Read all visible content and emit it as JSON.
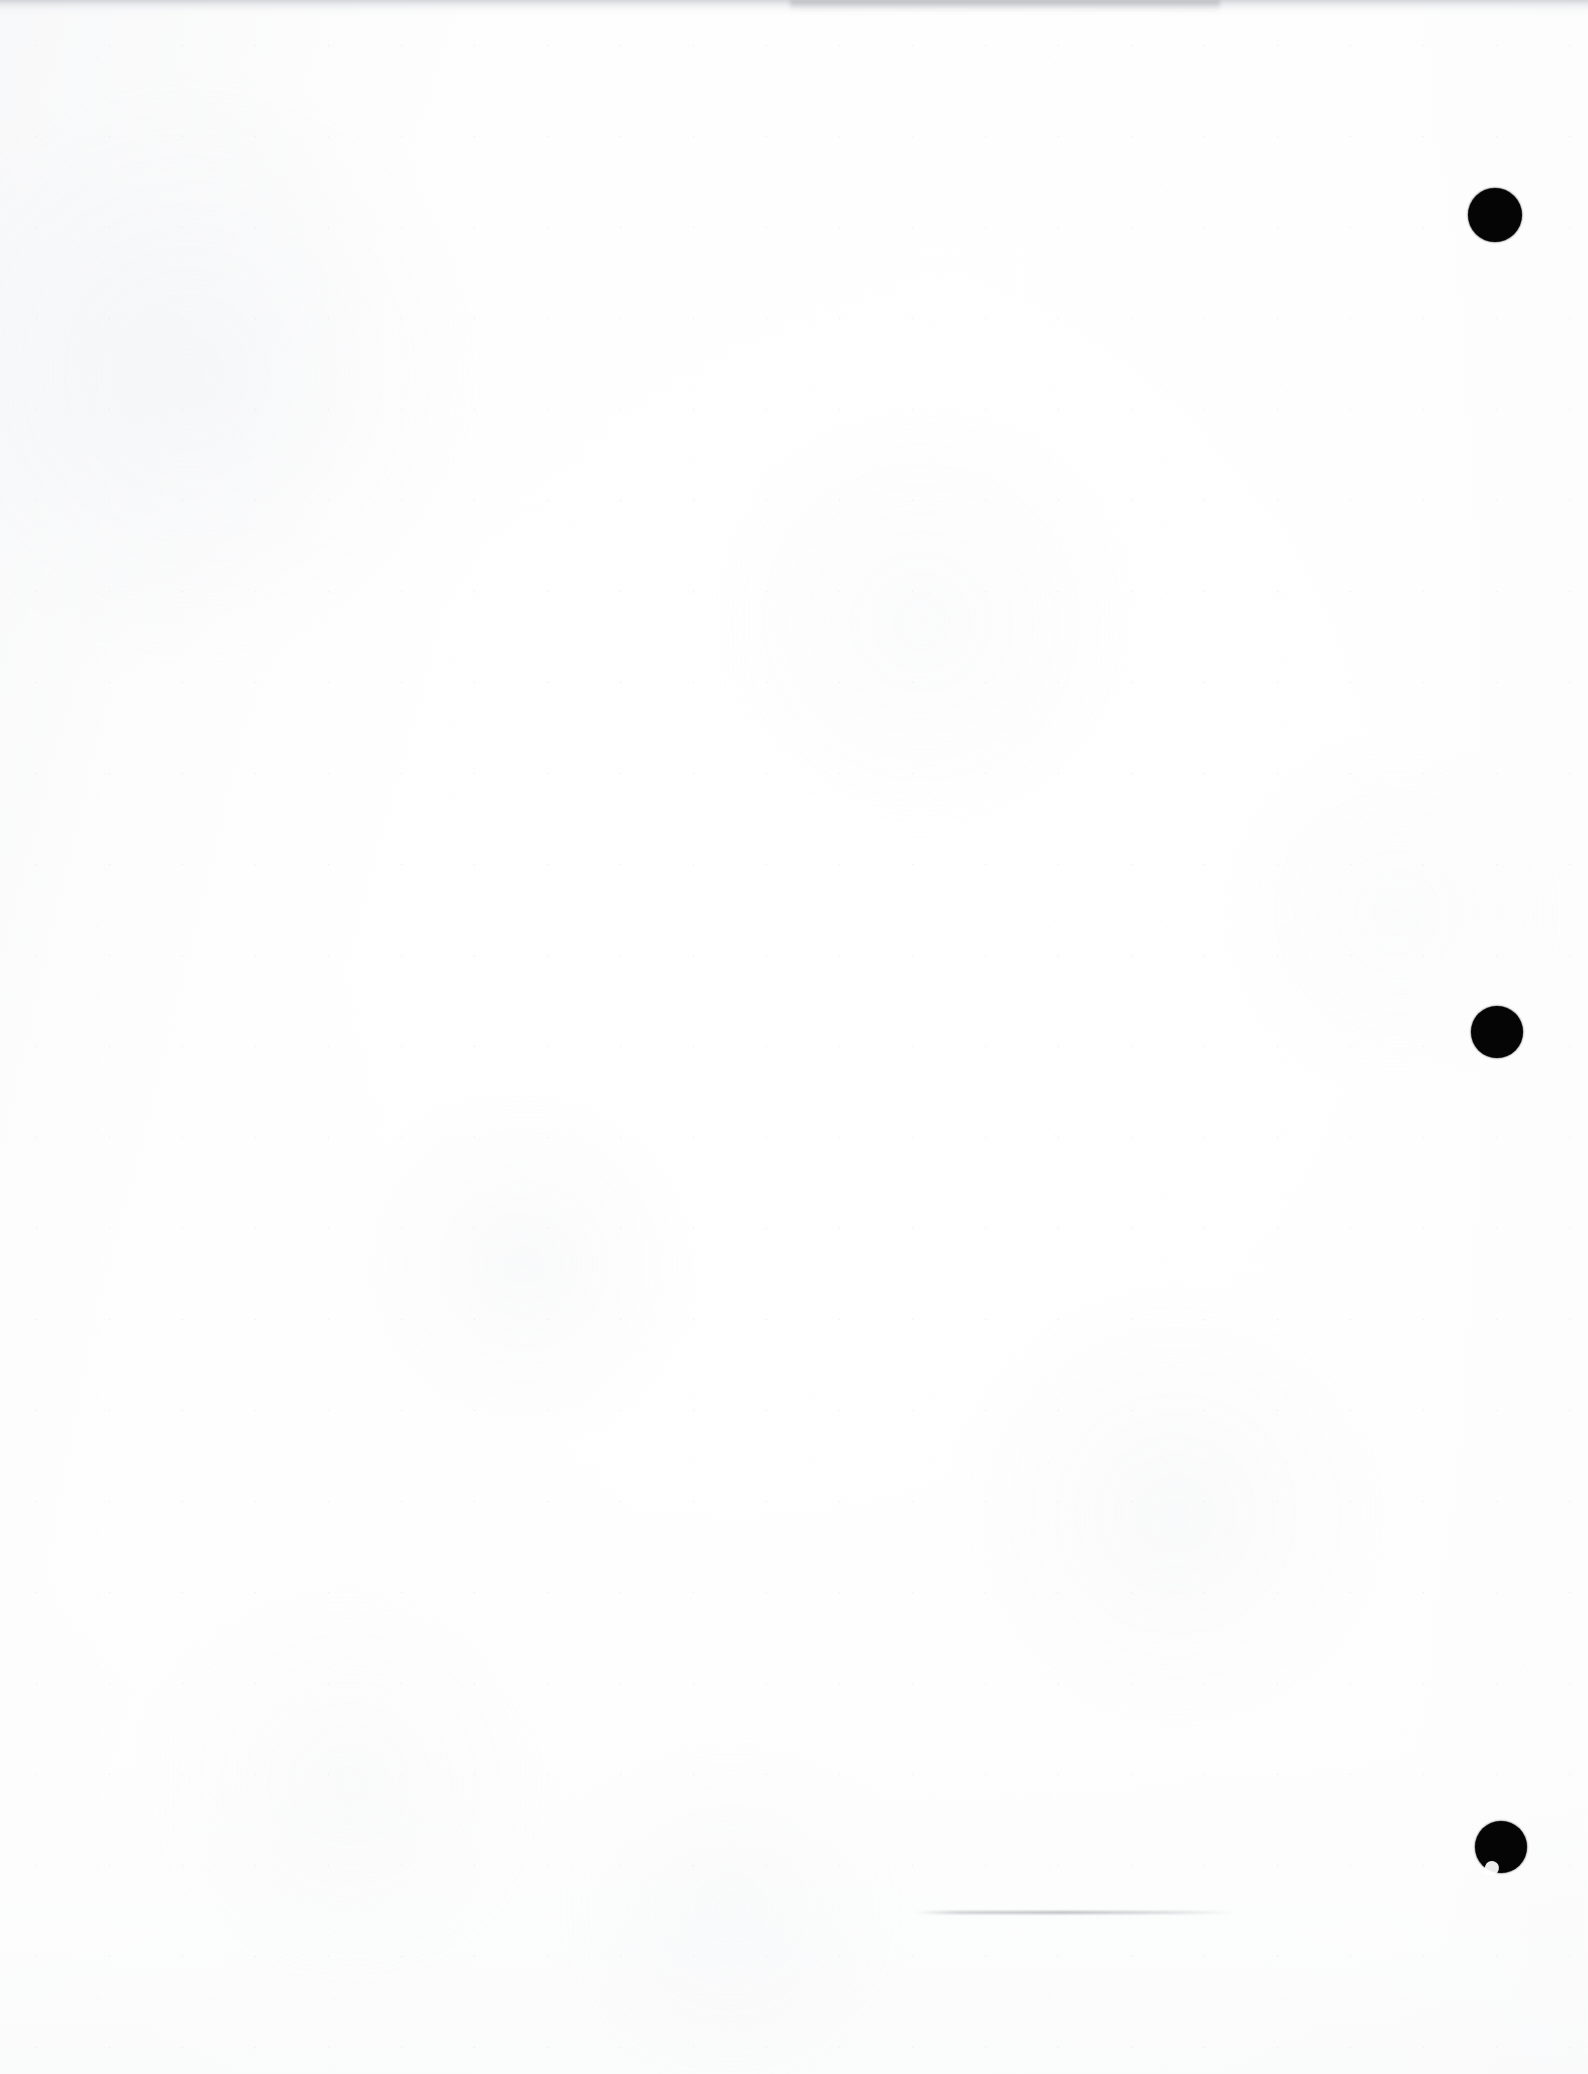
{
  "document": {
    "kind": "scanned-blank-page",
    "page_label": "",
    "visible_text": "",
    "background_color": "#ffffff",
    "ink_color": "#050505",
    "width_px": 1588,
    "height_px": 2074
  },
  "marks": {
    "registration_marks_label": "",
    "items": [
      {
        "id": "registration-mark-top",
        "shape": "filled-circle",
        "color": "#050505",
        "center_x": 1495,
        "center_y": 215,
        "radius": 27,
        "notched": false
      },
      {
        "id": "registration-mark-middle",
        "shape": "filled-circle",
        "color": "#050505",
        "center_x": 1497,
        "center_y": 1032,
        "radius": 26,
        "notched": false
      },
      {
        "id": "registration-mark-bottom",
        "shape": "filled-circle",
        "color": "#050505",
        "center_x": 1501,
        "center_y": 1847,
        "radius": 26,
        "notched": true
      }
    ]
  },
  "artifacts": {
    "top_edge_band": {
      "label": "",
      "color": "#c4c6ca",
      "top": 0,
      "height": 16
    },
    "top_edge_smudge": {
      "label": "",
      "color": "#96989d",
      "left": 790,
      "top": 0,
      "width": 430,
      "height": 11
    },
    "bottom_smudge_line": {
      "label": "",
      "color": "#94969c",
      "left": 915,
      "top": 1911,
      "width": 320,
      "height": 3
    }
  }
}
